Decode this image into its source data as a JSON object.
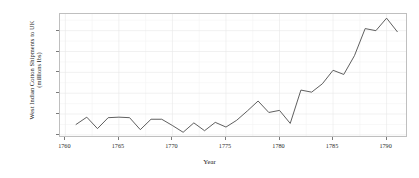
{
  "chart_data": {
    "type": "line",
    "title": "",
    "xlabel": "Year",
    "ylabel": "West Indian Cotton Shipments to UK (millions lbs)",
    "ylabel_line1": "West Indian Cotton Shipments to UK",
    "ylabel_line2": "(millions lbs)",
    "xlim": [
      1759.5,
      1792.0
    ],
    "ylim": [
      1.7,
      13.6
    ],
    "x_ticks": [
      1760,
      1765,
      1770,
      1775,
      1780,
      1785,
      1790
    ],
    "x_tick_labels": [
      "1760",
      "1765",
      "1770",
      "1775",
      "1780",
      "1785",
      "1790"
    ],
    "y_ticks": [
      2,
      4,
      6,
      8,
      10,
      12
    ],
    "y_tick_labels": [
      "2",
      "4",
      "6",
      "8",
      "10",
      "12"
    ],
    "grid": true,
    "grid_major_color": "#e8e8e8",
    "grid_minor_color": "#f4f4f4",
    "legend": null,
    "line_color": "#4d4d4d",
    "line_width": 0.9,
    "panel_background": "#ffffff",
    "panel_border_color": "#bfbfbf",
    "x": [
      1761,
      1762,
      1763,
      1764,
      1765,
      1766,
      1767,
      1768,
      1769,
      1770,
      1771,
      1772,
      1773,
      1774,
      1775,
      1776,
      1777,
      1778,
      1779,
      1780,
      1781,
      1782,
      1783,
      1784,
      1785,
      1786,
      1787,
      1788,
      1789,
      1790,
      1791
    ],
    "values": [
      3.0,
      3.7,
      2.6,
      3.65,
      3.7,
      3.65,
      2.5,
      3.5,
      3.5,
      2.9,
      2.25,
      3.15,
      2.4,
      3.2,
      2.75,
      3.4,
      4.3,
      5.25,
      4.15,
      4.35,
      3.1,
      6.3,
      6.1,
      6.9,
      8.2,
      7.8,
      9.6,
      12.2,
      12.0,
      13.2,
      11.9
    ],
    "series": [
      {
        "name": "West Indian cotton shipments",
        "values": [
          3.0,
          3.7,
          2.6,
          3.65,
          3.7,
          3.65,
          2.5,
          3.5,
          3.5,
          2.9,
          2.25,
          3.15,
          2.4,
          3.2,
          2.75,
          3.4,
          4.3,
          5.25,
          4.15,
          4.35,
          3.1,
          6.3,
          6.1,
          6.9,
          8.2,
          7.8,
          9.6,
          12.2,
          12.0,
          13.2,
          11.9
        ]
      }
    ]
  }
}
